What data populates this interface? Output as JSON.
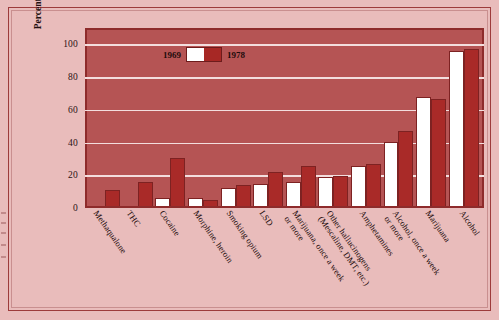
{
  "chart_data": {
    "type": "bar",
    "title": "",
    "xlabel": "",
    "ylabel": "Percentage",
    "ylim": [
      0,
      110
    ],
    "yticks": [
      0,
      20,
      40,
      60,
      80,
      100
    ],
    "grid": true,
    "legend_position": "top-center",
    "categories": [
      "Methaqualone",
      "THC",
      "Cocaine",
      "Morphine, heroin",
      "Smoking opium",
      "LSD",
      "Marijuana, once a week\nor more",
      "Other hallucinogens\n(Mescaline, DMT, etc.)",
      "Amphetamines",
      "Alcohol, once a week\nor more",
      "Marijuana",
      "Alcohol"
    ],
    "series": [
      {
        "name": "1969",
        "color": "#ffffff",
        "values": [
          0,
          0,
          5,
          5,
          11,
          14,
          15,
          18,
          25,
          40,
          68,
          97
        ]
      },
      {
        "name": "1978",
        "color": "#a92a28",
        "values": [
          10,
          15,
          30,
          4,
          13,
          21,
          25,
          19,
          26,
          47,
          67,
          98
        ]
      }
    ]
  },
  "legend": {
    "left_label": "1969",
    "right_label": "1978"
  },
  "yaxis": {
    "ticks": [
      "100",
      "80",
      "60",
      "40",
      "20",
      "0"
    ],
    "label": "Percentage"
  }
}
